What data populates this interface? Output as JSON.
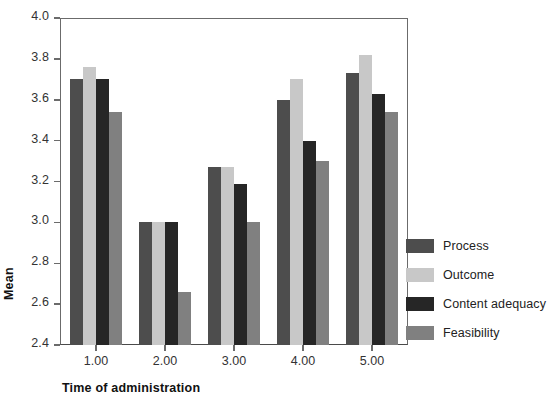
{
  "chart_data": {
    "type": "bar",
    "title": "",
    "xlabel": "Time of administration",
    "ylabel": "Mean",
    "categories": [
      "1.00",
      "2.00",
      "3.00",
      "4.00",
      "5.00"
    ],
    "series": [
      {
        "name": "Process",
        "color": "#4d4d4d",
        "values": [
          3.7,
          3.0,
          3.27,
          3.6,
          3.73
        ]
      },
      {
        "name": "Outcome",
        "color": "#c8c8c8",
        "values": [
          3.76,
          3.0,
          3.27,
          3.7,
          3.82
        ]
      },
      {
        "name": "Content adequacy",
        "color": "#262626",
        "values": [
          3.7,
          3.0,
          3.19,
          3.4,
          3.63
        ]
      },
      {
        "name": "Feasibility",
        "color": "#808080",
        "values": [
          3.54,
          2.66,
          3.0,
          3.3,
          3.54
        ]
      }
    ],
    "ylim": [
      2.4,
      4.0
    ],
    "ytick_step": 0.2,
    "yticks": [
      "4.0",
      "3.8",
      "3.6",
      "3.4",
      "3.2",
      "3.0",
      "2.8",
      "2.6",
      "2.4"
    ],
    "grid": false,
    "legend_position": "right"
  },
  "axis": {
    "y_title": "Mean",
    "x_title": "Time of administration"
  },
  "legend": {
    "items": [
      {
        "label": "Process",
        "color": "#4d4d4d"
      },
      {
        "label": "Outcome",
        "color": "#c8c8c8"
      },
      {
        "label": "Content adequacy",
        "color": "#262626"
      },
      {
        "label": "Feasibility",
        "color": "#808080"
      }
    ]
  },
  "colors": {
    "axis_line": "#6b6b6b",
    "text": "#222222",
    "background": "#ffffff"
  }
}
